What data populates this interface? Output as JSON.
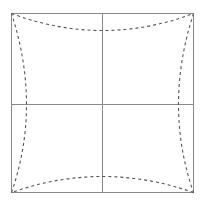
{
  "canvas": {
    "width": 203,
    "height": 202,
    "background_color": "#ffffff"
  },
  "figure": {
    "title": ""
  },
  "chart_data": {
    "type": "line",
    "title": "",
    "subtitle": "",
    "xlabel": "",
    "ylabel": "",
    "grid": false,
    "legend_position": "none",
    "xlim": [
      11,
      193
    ],
    "ylim": [
      13,
      192
    ],
    "annotations": [],
    "tick_labels": {
      "x": [],
      "y": []
    },
    "series": [
      {
        "name": "frame-border",
        "style": "solid",
        "color": "#8a8a8a",
        "width": 1,
        "closed": true,
        "points": [
          [
            11,
            13
          ],
          [
            193,
            13
          ],
          [
            193,
            192
          ],
          [
            11,
            192
          ]
        ]
      },
      {
        "name": "center-vertical-axis",
        "style": "solid",
        "color": "#8a8a8a",
        "width": 1,
        "closed": false,
        "points": [
          [
            102,
            13
          ],
          [
            102,
            192
          ]
        ]
      },
      {
        "name": "center-horizontal-axis",
        "style": "solid",
        "color": "#8a8a8a",
        "width": 1,
        "closed": false,
        "points": [
          [
            11,
            104
          ],
          [
            193,
            104
          ]
        ]
      },
      {
        "name": "top-distortion-curve",
        "style": "dashed",
        "color": "#555555",
        "width": 1,
        "closed": false,
        "dash_on": 3,
        "dash_off": 3,
        "endpoints": [
          [
            11,
            13
          ],
          [
            193,
            13
          ]
        ],
        "midpoint": [
          102,
          30
        ]
      },
      {
        "name": "right-distortion-curve",
        "style": "dashed",
        "color": "#555555",
        "width": 1,
        "closed": false,
        "dash_on": 3,
        "dash_off": 3,
        "endpoints": [
          [
            193,
            13
          ],
          [
            193,
            192
          ]
        ],
        "midpoint": [
          178,
          104
        ]
      },
      {
        "name": "bottom-distortion-curve",
        "style": "dashed",
        "color": "#555555",
        "width": 1,
        "closed": false,
        "dash_on": 3,
        "dash_off": 3,
        "endpoints": [
          [
            193,
            192
          ],
          [
            11,
            192
          ]
        ],
        "midpoint": [
          102,
          176
        ]
      },
      {
        "name": "left-distortion-curve",
        "style": "dashed",
        "color": "#555555",
        "width": 1,
        "closed": false,
        "dash_on": 3,
        "dash_off": 3,
        "endpoints": [
          [
            11,
            192
          ],
          [
            11,
            13
          ]
        ],
        "midpoint": [
          26,
          104
        ]
      }
    ]
  },
  "colors": {
    "frame_stroke": "#8a8a8a",
    "axis_stroke": "#8a8a8a",
    "dashed_stroke": "#555555",
    "background": "#ffffff"
  }
}
